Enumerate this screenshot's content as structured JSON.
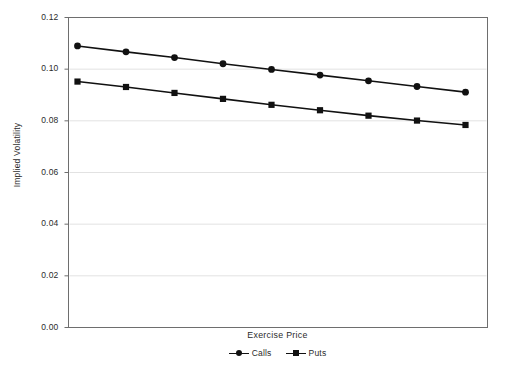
{
  "chart_data": {
    "type": "line",
    "title": "",
    "xlabel": "Exercise Price",
    "ylabel": "Implied Volatility",
    "x": [
      1,
      2,
      3,
      4,
      5,
      6,
      7,
      8,
      9
    ],
    "xticklabels": [],
    "yticklabels": [
      "0.00",
      "0.02",
      "0.04",
      "0.06",
      "0.08",
      "0.10",
      "0.12"
    ],
    "yticks": [
      0.0,
      0.02,
      0.04,
      0.06,
      0.08,
      0.1,
      0.12
    ],
    "ylim": [
      0.0,
      0.12
    ],
    "grid": "horizontal",
    "legend_position": "bottom",
    "series": [
      {
        "name": "Calls",
        "marker": "circle",
        "color": "#111111",
        "values": [
          0.109,
          0.1067,
          0.1045,
          0.1021,
          0.0999,
          0.0977,
          0.0955,
          0.0933,
          0.0911
        ]
      },
      {
        "name": "Puts",
        "marker": "square",
        "color": "#111111",
        "values": [
          0.0952,
          0.0931,
          0.0908,
          0.0885,
          0.0862,
          0.0841,
          0.082,
          0.0801,
          0.0784
        ]
      }
    ]
  },
  "style": {
    "frame_color": "#6e6e6e",
    "grid_color": "#e2e2e2",
    "background": "#ffffff",
    "series_color": "#111111"
  }
}
